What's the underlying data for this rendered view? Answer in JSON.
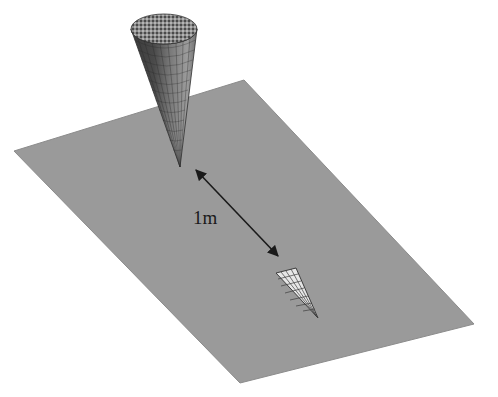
{
  "diagram": {
    "distance_label": "1m",
    "colors": {
      "background": "#ffffff",
      "plane": "#9a9a9a",
      "plane_edge": "#8c8c8c",
      "cone_dark": "#3a3a3a",
      "cone_mid": "#6e6e6e",
      "cone_light": "#9c9c9c",
      "cone_top": "#7a7a7a",
      "arrow": "#1a1a1a",
      "footprint": "#e8e8e8",
      "footprint_lines": "#3c3c3c"
    },
    "plane_corners": {
      "left": [
        14,
        151
      ],
      "top": [
        244,
        80
      ],
      "right": [
        474,
        324
      ],
      "bottom": [
        240,
        383
      ]
    },
    "cone": {
      "top_center": [
        164,
        29
      ],
      "top_rx": 33,
      "top_ry": 15,
      "tip": [
        180,
        167
      ]
    },
    "arrow": {
      "start": [
        196,
        170
      ],
      "end": [
        278,
        256
      ]
    },
    "footprint": {
      "corner_a": [
        276,
        273
      ],
      "corner_b": [
        296,
        268
      ],
      "tip": [
        318,
        318
      ]
    }
  }
}
